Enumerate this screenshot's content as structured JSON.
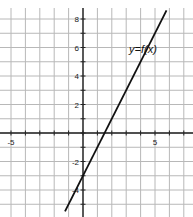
{
  "chart_data": {
    "type": "line",
    "title": "",
    "xlabel": "",
    "ylabel": "",
    "xlim": [
      -5.8,
      7.5
    ],
    "ylim": [
      -5.8,
      9.3
    ],
    "grid": true,
    "x_tick_labels": [
      {
        "value": -5,
        "label": "-5"
      },
      {
        "value": 5,
        "label": "5"
      }
    ],
    "y_tick_labels": [
      {
        "value": 8,
        "label": "8"
      },
      {
        "value": 6,
        "label": "6"
      },
      {
        "value": 4,
        "label": "4"
      },
      {
        "value": 2,
        "label": "2"
      },
      {
        "value": -2,
        "label": "-2"
      },
      {
        "value": -4,
        "label": "-4"
      }
    ],
    "series": [
      {
        "name": "y=f(x)",
        "equation": "y = 2x - 3",
        "x": [
          -1.25,
          5.8
        ],
        "y": [
          -5.5,
          8.6
        ]
      }
    ],
    "annotations": [
      {
        "text": "y=f(x)",
        "x": 3.2,
        "y": 5.6
      }
    ]
  },
  "colors": {
    "grid": "#b8b8b8",
    "axis": "#222222",
    "line": "#111111"
  }
}
